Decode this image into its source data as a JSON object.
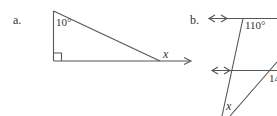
{
  "figures": {
    "a": {
      "label": "a.",
      "angle_top": "10°",
      "unknown": "x"
    },
    "b": {
      "label": "b.",
      "angle_top": "110°",
      "angle_right": "14",
      "unknown": "x"
    }
  },
  "colors": {
    "line": "#555555",
    "text": "#333333"
  }
}
